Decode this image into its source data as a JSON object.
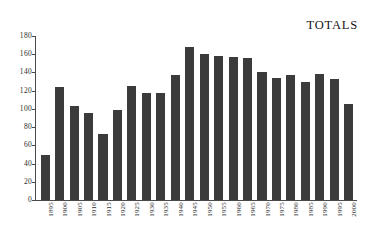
{
  "chart_data": {
    "type": "bar",
    "title": "TOTALS",
    "xlabel": "",
    "ylabel": "",
    "ylim": [
      0,
      180
    ],
    "ytick_values": [
      0,
      20,
      40,
      60,
      80,
      100,
      120,
      140,
      160,
      180
    ],
    "ytick_labels": [
      "0",
      "20",
      "40",
      "60",
      "80",
      "100",
      "120",
      "140",
      "160",
      "180"
    ],
    "grid": false,
    "legend": "none",
    "bar_color": "#3b3b3b",
    "background_color": "#ffffff",
    "axis_color": "#4a4a4a",
    "categories": [
      "1895",
      "1900",
      "1905",
      "1910",
      "1915",
      "1920",
      "1925",
      "1930",
      "1935",
      "1940",
      "1945",
      "1950",
      "1955",
      "1960",
      "1965",
      "1970",
      "1975",
      "1980",
      "1985",
      "1990",
      "1995",
      "2000"
    ],
    "values": [
      49,
      124,
      103,
      96,
      73,
      99,
      125,
      118,
      117,
      137,
      168,
      160,
      158,
      157,
      156,
      140,
      134,
      137,
      129,
      138,
      133,
      105
    ]
  },
  "chart": {
    "title_label": "TOTALS"
  }
}
